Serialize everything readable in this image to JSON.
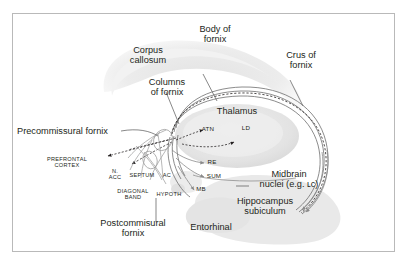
{
  "figure": {
    "background_color": "#ffffff",
    "frame_color": "#b9b9b9",
    "ink_color": "#231f20",
    "structure_fill": "#e8e8e8"
  },
  "labels": {
    "corpus_callosum": "Corpus\ncallosum",
    "body_of_fornix": "Body of\nfornix",
    "crus_of_fornix": "Crus of\nfornix",
    "columns_of_fornix": "Columns\nof fornix",
    "precommissural_fornix": "Precommissural fornix",
    "postcommisural_fornix": "Postcommisural\nfornix",
    "thalamus": "Thalamus",
    "midbrain_nuclei": "Midbrain\nnuclei (e.g. ʟᴄ)",
    "hippocampus_subiculum": "Hippocampus\nsubiculum",
    "entorhinal": "Entorhinal",
    "prefrontal_cortex": "PREFRONTAL\nCORTEX",
    "n_acc": "N.\nACC",
    "septum": "SEPTUM",
    "ac": "AC",
    "diagonal_band": "DIAGONAL\nBAND",
    "hypoth": "HYPOTH",
    "atn": "ATN",
    "ld": "LD",
    "re": "RE",
    "sum": "SUM",
    "mb": "MB"
  }
}
